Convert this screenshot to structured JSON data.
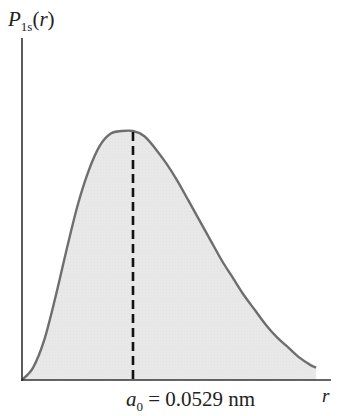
{
  "chart_data": {
    "type": "area",
    "title": "",
    "ylabel": "P_1s(r)",
    "ylabel_parts": {
      "main": "P",
      "sub": "1s",
      "arg": "r"
    },
    "xlabel": "r",
    "x_unit": "a0",
    "x": [
      0,
      0.1,
      0.2,
      0.3,
      0.4,
      0.5,
      0.6,
      0.7,
      0.8,
      0.9,
      1.0,
      1.1,
      1.2,
      1.3,
      1.4,
      1.5,
      1.6,
      1.7,
      1.8,
      1.9,
      2.0,
      2.1,
      2.2,
      2.3,
      2.4,
      2.5,
      2.6,
      2.65
    ],
    "values": [
      0.0,
      0.05,
      0.16,
      0.33,
      0.52,
      0.7,
      0.84,
      0.94,
      0.99,
      1.0,
      1.0,
      0.98,
      0.93,
      0.87,
      0.8,
      0.72,
      0.64,
      0.56,
      0.48,
      0.41,
      0.34,
      0.28,
      0.22,
      0.17,
      0.13,
      0.09,
      0.06,
      0.05
    ],
    "peak": {
      "x": 1.0,
      "label": "a0 = 0.0529 nm"
    },
    "annotation": {
      "symbol": "a",
      "subscript": "0",
      "text": "= 0.0529 nm"
    },
    "xlim": [
      0,
      2.8
    ],
    "ylim": [
      0,
      1.0
    ],
    "grid": false,
    "legend": null,
    "colors": {
      "fill": "#e6e6e6",
      "curve": "#6e6e6e",
      "axis": "#333333",
      "dashed_line": "#111111"
    }
  }
}
